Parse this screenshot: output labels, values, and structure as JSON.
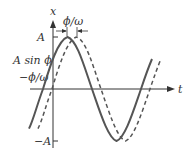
{
  "diagram": {
    "axes": {
      "x_label": "x",
      "t_label": "t"
    },
    "ticks": {
      "A": "A",
      "A_sin_phi": "A sin ϕ",
      "neg_phi_omega": "−ϕ/ω",
      "neg_A": "−A"
    },
    "annotation": {
      "phase_shift": "ϕ/ω"
    },
    "curves": [
      {
        "name": "solid",
        "style": "solid",
        "description": "x = A sin(ωt + ϕ)"
      },
      {
        "name": "dashed",
        "style": "dashed",
        "description": "x = A sin(ωt)"
      }
    ],
    "colors": {
      "curve": "#555555",
      "axis": "#333333"
    }
  }
}
